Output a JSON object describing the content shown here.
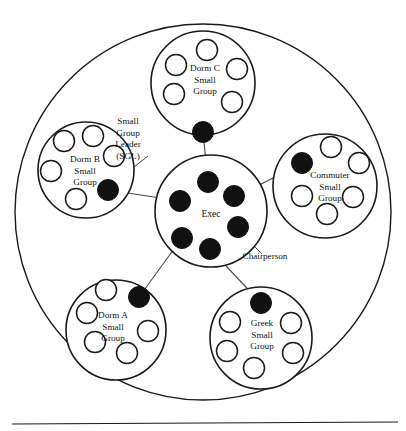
{
  "diagram": {
    "colors": {
      "stroke": "#1a1a1a",
      "background": "#ffffff",
      "leader_fill": "#111111",
      "member_fill": "#ffffff",
      "connector": "#4a4a4a"
    },
    "outer_circle": {
      "cx": 203,
      "cy": 212,
      "r": 188
    },
    "baseline_rule": {
      "x1": 12,
      "y1": 424,
      "x2": 398,
      "y2": 422
    },
    "center": {
      "name": "exec",
      "label": "Exec",
      "cx": 211,
      "cy": 211,
      "r": 56,
      "label_x": 211,
      "label_y": 217,
      "members": [
        {
          "name": "exec-member-top",
          "cx": 208,
          "cy": 182,
          "r": 10.5,
          "type": "leader"
        },
        {
          "name": "exec-member-upper-right",
          "cx": 234,
          "cy": 196,
          "r": 10.5,
          "type": "leader"
        },
        {
          "name": "exec-member-right",
          "cx": 238,
          "cy": 227,
          "r": 10.5,
          "type": "leader"
        },
        {
          "name": "exec-member-lower-right",
          "cx": 210,
          "cy": 249,
          "r": 10.5,
          "type": "leader"
        },
        {
          "name": "exec-member-lower-left",
          "cx": 182,
          "cy": 238,
          "r": 10.5,
          "type": "leader"
        },
        {
          "name": "exec-member-left",
          "cx": 180,
          "cy": 201,
          "r": 10.5,
          "type": "leader"
        }
      ]
    },
    "groups": [
      {
        "name": "dorm-c-small-group",
        "label_lines": [
          "Dorm C",
          "Small",
          "Group"
        ],
        "cx": 203,
        "cy": 83,
        "r": 52,
        "label_x": 205,
        "label_y": 71,
        "leader": {
          "name": "dorm-c-leader",
          "cx": 203,
          "cy": 132,
          "r": 10.5
        },
        "members": [
          {
            "cx": 207,
            "cy": 50,
            "r": 10.5
          },
          {
            "cx": 176,
            "cy": 65,
            "r": 10.5
          },
          {
            "cx": 237,
            "cy": 69,
            "r": 10.5
          },
          {
            "cx": 174,
            "cy": 94,
            "r": 10.5
          },
          {
            "cx": 232,
            "cy": 102,
            "r": 10.5
          }
        ]
      },
      {
        "name": "dorm-b-small-group",
        "label_lines": [
          "Dorm B",
          "Small",
          "Group"
        ],
        "cx": 86,
        "cy": 170,
        "r": 48,
        "label_x": 85,
        "label_y": 162,
        "leader": {
          "name": "dorm-b-leader",
          "cx": 108,
          "cy": 190,
          "r": 10.5
        },
        "members": [
          {
            "cx": 64,
            "cy": 141,
            "r": 10.5
          },
          {
            "cx": 93,
            "cy": 136,
            "r": 10.5
          },
          {
            "cx": 114,
            "cy": 156,
            "r": 10.5
          },
          {
            "cx": 51,
            "cy": 171,
            "r": 10.5
          },
          {
            "cx": 76,
            "cy": 199,
            "r": 10.5
          }
        ]
      },
      {
        "name": "commuter-small-group",
        "label_lines": [
          "Commuter",
          "Small",
          "Group"
        ],
        "cx": 325,
        "cy": 186,
        "r": 52,
        "label_x": 330,
        "label_y": 178,
        "leader": {
          "name": "commuter-leader",
          "cx": 302,
          "cy": 163,
          "r": 10.5
        },
        "members": [
          {
            "cx": 331,
            "cy": 147,
            "r": 10.5
          },
          {
            "cx": 359,
            "cy": 163,
            "r": 10.5
          },
          {
            "cx": 302,
            "cy": 196,
            "r": 10.5
          },
          {
            "cx": 353,
            "cy": 197,
            "r": 10.5
          },
          {
            "cx": 327,
            "cy": 214,
            "r": 10.5
          }
        ]
      },
      {
        "name": "dorm-a-small-group",
        "label_lines": [
          "Dorm A",
          "Small",
          "Group"
        ],
        "cx": 116,
        "cy": 330,
        "r": 50,
        "label_x": 113,
        "label_y": 318,
        "leader": {
          "name": "dorm-a-leader",
          "cx": 139,
          "cy": 297,
          "r": 10.5
        },
        "members": [
          {
            "cx": 106,
            "cy": 290,
            "r": 10.5
          },
          {
            "cx": 87,
            "cy": 313,
            "r": 10.5
          },
          {
            "cx": 148,
            "cy": 331,
            "r": 10.5
          },
          {
            "cx": 95,
            "cy": 342,
            "r": 10.5
          },
          {
            "cx": 127,
            "cy": 353,
            "r": 10.5
          }
        ]
      },
      {
        "name": "greek-small-group",
        "label_lines": [
          "Greek",
          "Small",
          "Group"
        ],
        "cx": 261,
        "cy": 338,
        "r": 51,
        "label_x": 262,
        "label_y": 326,
        "leader": {
          "name": "greek-leader",
          "cx": 261,
          "cy": 303,
          "r": 10.5
        },
        "members": [
          {
            "cx": 230,
            "cy": 322,
            "r": 10.5
          },
          {
            "cx": 291,
            "cy": 323,
            "r": 10.5
          },
          {
            "cx": 227,
            "cy": 351,
            "r": 10.5
          },
          {
            "cx": 293,
            "cy": 353,
            "r": 10.5
          },
          {
            "cx": 254,
            "cy": 368,
            "r": 10.5
          }
        ]
      }
    ],
    "connectors": [
      {
        "name": "connector-dorm-c-to-exec",
        "x1": 203,
        "y1": 132,
        "x2": 208,
        "y2": 182
      },
      {
        "name": "connector-dorm-b-to-exec",
        "x1": 108,
        "y1": 190,
        "x2": 180,
        "y2": 201
      },
      {
        "name": "connector-commuter-to-exec",
        "x1": 302,
        "y1": 163,
        "x2": 238,
        "y2": 196
      },
      {
        "name": "connector-dorm-a-to-exec",
        "x1": 139,
        "y1": 297,
        "x2": 182,
        "y2": 238
      },
      {
        "name": "connector-greek-to-exec",
        "x1": 261,
        "y1": 303,
        "x2": 210,
        "y2": 249
      }
    ],
    "annotations": [
      {
        "name": "sgl-annotation",
        "label_lines": [
          "Small",
          "Group",
          "Leader",
          "(SGL)"
        ],
        "label_x": 128,
        "label_y": 124,
        "leader_line": {
          "x1": 148,
          "y1": 156,
          "x2": 110,
          "y2": 186
        }
      },
      {
        "name": "chairperson-annotation",
        "label_lines": [
          "Chairperson"
        ],
        "label_x": 265,
        "label_y": 259,
        "leader_line": {
          "x1": 262,
          "y1": 254,
          "x2": 237,
          "y2": 229
        }
      }
    ]
  }
}
